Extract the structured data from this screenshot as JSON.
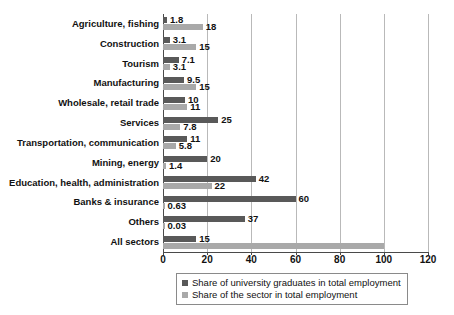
{
  "chart_data": {
    "type": "bar",
    "orientation": "horizontal",
    "title": "",
    "xlabel": "",
    "ylabel": "",
    "xlim": [
      0,
      120
    ],
    "xticks": [
      0,
      20,
      40,
      60,
      80,
      100,
      120
    ],
    "grid": true,
    "legend_position": "bottom",
    "categories": [
      "Agriculture, fishing",
      "Construction",
      "Tourism",
      "Manufacturing",
      "Wholesale, retail trade",
      "Services",
      "Transportation, communication",
      "Mining, energy",
      "Education, health, administration",
      "Banks & insurance",
      "Others",
      "All sectors"
    ],
    "series": [
      {
        "name": "Share of university graduates in total employment",
        "color": "#595959",
        "values": [
          1.8,
          3.1,
          7.1,
          9.5,
          10,
          25,
          11,
          20,
          42,
          60,
          37,
          15
        ],
        "labels": [
          "1.8",
          "3.1",
          "7.1",
          "9.5",
          "10",
          "25",
          "11",
          "20",
          "42",
          "60",
          "37",
          "15"
        ]
      },
      {
        "name": "Share of the sector in total employment",
        "color": "#a9a9a9",
        "values": [
          18,
          15,
          3.1,
          15,
          11,
          7.8,
          5.8,
          1.4,
          22,
          0.63,
          0.03,
          100
        ],
        "labels": [
          "18",
          "15",
          "3.1",
          "15",
          "11",
          "7.8",
          "5.8",
          "1.4",
          "22",
          "0.63",
          "0.03",
          ""
        ]
      }
    ]
  },
  "legend": {
    "items": [
      {
        "label": "Share of university graduates in total employment"
      },
      {
        "label": "Share of the sector in total employment"
      }
    ]
  },
  "caption": {
    "text": ""
  }
}
